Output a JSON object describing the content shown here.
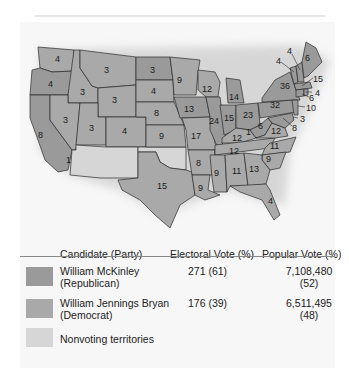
{
  "map": {
    "title": "",
    "colors": {
      "republican": "#9a9a9a",
      "democrat": "#a9a9a9",
      "nonvoting": "#d6d6d6",
      "border": "#2a2a2a"
    },
    "state_labels": [
      {
        "state": "Washington",
        "votes": "4"
      },
      {
        "state": "Oregon",
        "votes": "4"
      },
      {
        "state": "California",
        "votes": "8"
      },
      {
        "state": "California (split)",
        "votes": "1"
      },
      {
        "state": "Idaho",
        "votes": "3"
      },
      {
        "state": "Nevada",
        "votes": "3"
      },
      {
        "state": "Montana",
        "votes": "3"
      },
      {
        "state": "Wyoming",
        "votes": "3"
      },
      {
        "state": "Utah",
        "votes": "3"
      },
      {
        "state": "Colorado",
        "votes": "4"
      },
      {
        "state": "North Dakota",
        "votes": "3"
      },
      {
        "state": "South Dakota",
        "votes": "4"
      },
      {
        "state": "Nebraska",
        "votes": "8"
      },
      {
        "state": "Kansas",
        "votes": "9"
      },
      {
        "state": "Texas",
        "votes": "15"
      },
      {
        "state": "Minnesota",
        "votes": "9"
      },
      {
        "state": "Iowa",
        "votes": "13"
      },
      {
        "state": "Missouri",
        "votes": "17"
      },
      {
        "state": "Arkansas",
        "votes": "8"
      },
      {
        "state": "Louisiana",
        "votes": "9"
      },
      {
        "state": "Wisconsin",
        "votes": "12"
      },
      {
        "state": "Illinois",
        "votes": "24"
      },
      {
        "state": "Michigan",
        "votes": "14"
      },
      {
        "state": "Indiana",
        "votes": "15"
      },
      {
        "state": "Ohio",
        "votes": "23"
      },
      {
        "state": "Kentucky",
        "votes": "12"
      },
      {
        "state": "Kentucky (split)",
        "votes": "1"
      },
      {
        "state": "Tennessee",
        "votes": "12"
      },
      {
        "state": "Mississippi",
        "votes": "9"
      },
      {
        "state": "Alabama",
        "votes": "11"
      },
      {
        "state": "Georgia",
        "votes": "13"
      },
      {
        "state": "Florida",
        "votes": "4"
      },
      {
        "state": "South Carolina",
        "votes": "9"
      },
      {
        "state": "North Carolina",
        "votes": "11"
      },
      {
        "state": "Virginia",
        "votes": "12"
      },
      {
        "state": "West Virginia",
        "votes": "6"
      },
      {
        "state": "Pennsylvania",
        "votes": "32"
      },
      {
        "state": "New York",
        "votes": "36"
      },
      {
        "state": "Vermont",
        "votes": "4"
      },
      {
        "state": "New Hampshire",
        "votes": "4"
      },
      {
        "state": "Maine",
        "votes": "6"
      },
      {
        "state": "Massachusetts",
        "votes": "15"
      },
      {
        "state": "Rhode Island",
        "votes": "4"
      },
      {
        "state": "Connecticut",
        "votes": "6"
      },
      {
        "state": "New Jersey",
        "votes": "10"
      },
      {
        "state": "Delaware",
        "votes": "3"
      },
      {
        "state": "Maryland",
        "votes": "8"
      }
    ]
  },
  "legend": {
    "headers": {
      "candidate": "Candidate (Party)",
      "electoral": "Electoral Vote (%)",
      "popular": "Popular Vote (%)"
    },
    "rows": [
      {
        "name": "William McKinley",
        "party": "(Republican)",
        "electoral": "271 (61)",
        "popular": "7,108,480",
        "popular_pct": "(52)",
        "color": "#9a9a9a"
      },
      {
        "name": "William Jennings Bryan",
        "party": "(Democrat)",
        "electoral": "176 (39)",
        "popular": "6,511,495",
        "popular_pct": "(48)",
        "color": "#a9a9a9"
      },
      {
        "name": "Nonvoting territories",
        "party": "",
        "electoral": "",
        "popular": "",
        "popular_pct": "",
        "color": "#d6d6d6"
      }
    ]
  }
}
